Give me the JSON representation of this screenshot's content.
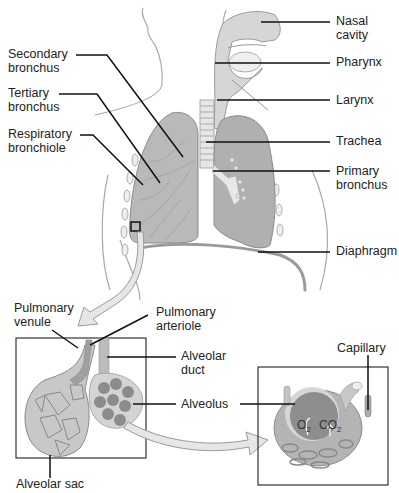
{
  "figure": {
    "colors": {
      "outline": "#9a9a9a",
      "lung_fill": "#b8b8b8",
      "lung_dark": "#8e8e8e",
      "airway_fill": "#dcdcdc",
      "leader_line": "#111111",
      "box_border": "#333333",
      "arrow_fill": "#e6e6e6"
    }
  },
  "labels": {
    "nasal_cavity": "Nasal\ncavity",
    "pharynx": "Pharynx",
    "larynx": "Larynx",
    "trachea": "Trachea",
    "primary_bronchus": "Primary\nbronchus",
    "diaphragm": "Diaphragm",
    "secondary_bronchus": "Secondary\nbronchus",
    "tertiary_bronchus": "Tertiary\nbronchus",
    "respiratory_bronchiole": "Respiratory\nbronchiole",
    "pulmonary_venule": "Pulmonary\nvenule",
    "pulmonary_arteriole": "Pulmonary\narteriole",
    "alveolar_duct": "Alveolar\nduct",
    "alveolus": "Alveolus",
    "alveolar_sac": "Alveolar sac",
    "capillary": "Capillary"
  },
  "gas_exchange": {
    "oxygen": "O",
    "oxygen_sub": "2",
    "carbon_dioxide": "CO",
    "carbon_dioxide_sub": "2"
  }
}
